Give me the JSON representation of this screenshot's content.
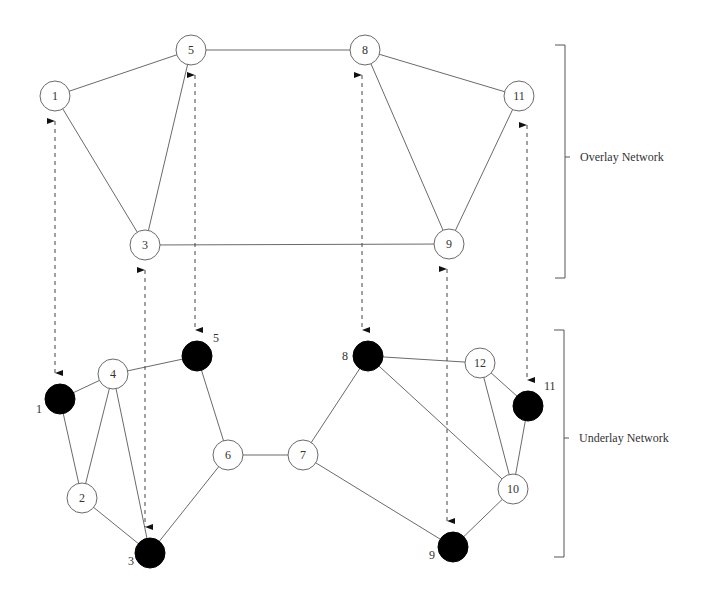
{
  "diagram": {
    "overlay": {
      "label": "Overlay Network",
      "bracket": {
        "x": 565,
        "y_top": 45,
        "y_bottom": 278,
        "tick_y": 157
      },
      "nodes": [
        {
          "id": "1",
          "label": "1",
          "x": 55,
          "y": 96
        },
        {
          "id": "5",
          "label": "5",
          "x": 191,
          "y": 50
        },
        {
          "id": "8",
          "label": "8",
          "x": 365,
          "y": 50
        },
        {
          "id": "11",
          "label": "11",
          "x": 519,
          "y": 96
        },
        {
          "id": "3",
          "label": "3",
          "x": 145,
          "y": 245
        },
        {
          "id": "9",
          "label": "9",
          "x": 449,
          "y": 244
        }
      ],
      "edges": [
        [
          "1",
          "5"
        ],
        [
          "1",
          "3"
        ],
        [
          "5",
          "3"
        ],
        [
          "5",
          "8"
        ],
        [
          "8",
          "11"
        ],
        [
          "8",
          "9"
        ],
        [
          "11",
          "9"
        ],
        [
          "3",
          "9"
        ]
      ]
    },
    "underlay": {
      "label": "Underlay Network",
      "bracket": {
        "x": 564,
        "y_top": 330,
        "y_bottom": 557,
        "tick_y": 438
      },
      "nodes": [
        {
          "id": "1",
          "label": "1",
          "x": 60,
          "y": 399,
          "filled": true
        },
        {
          "id": "2",
          "label": "2",
          "x": 82,
          "y": 498,
          "filled": false
        },
        {
          "id": "3",
          "label": "3",
          "x": 150,
          "y": 553,
          "filled": true
        },
        {
          "id": "4",
          "label": "4",
          "x": 113,
          "y": 374,
          "filled": false
        },
        {
          "id": "5",
          "label": "5",
          "x": 197,
          "y": 356,
          "filled": true
        },
        {
          "id": "6",
          "label": "6",
          "x": 228,
          "y": 455,
          "filled": false
        },
        {
          "id": "7",
          "label": "7",
          "x": 303,
          "y": 455,
          "filled": false
        },
        {
          "id": "8",
          "label": "8",
          "x": 368,
          "y": 356,
          "filled": true
        },
        {
          "id": "9",
          "label": "9",
          "x": 453,
          "y": 547,
          "filled": true
        },
        {
          "id": "10",
          "label": "10",
          "x": 513,
          "y": 489,
          "filled": false
        },
        {
          "id": "11",
          "label": "11",
          "x": 528,
          "y": 406,
          "filled": true
        },
        {
          "id": "12",
          "label": "12",
          "x": 480,
          "y": 363,
          "filled": false
        }
      ],
      "edges": [
        [
          "1",
          "4"
        ],
        [
          "1",
          "2"
        ],
        [
          "4",
          "2"
        ],
        [
          "4",
          "3"
        ],
        [
          "4",
          "5"
        ],
        [
          "2",
          "3"
        ],
        [
          "3",
          "6"
        ],
        [
          "5",
          "6"
        ],
        [
          "6",
          "7"
        ],
        [
          "7",
          "8"
        ],
        [
          "7",
          "9"
        ],
        [
          "8",
          "12"
        ],
        [
          "8",
          "10"
        ],
        [
          "12",
          "11"
        ],
        [
          "12",
          "10"
        ],
        [
          "11",
          "10"
        ],
        [
          "10",
          "9"
        ]
      ]
    },
    "mappings": [
      {
        "overlay": "1",
        "underlay": "1",
        "x": 55,
        "y_top": 113,
        "y_bottom": 381
      },
      {
        "overlay": "5",
        "underlay": "5",
        "x": 195,
        "y_top": 67,
        "y_bottom": 338
      },
      {
        "overlay": "3",
        "underlay": "3",
        "x": 145,
        "y_top": 262,
        "y_bottom": 535
      },
      {
        "overlay": "8",
        "underlay": "8",
        "x": 362,
        "y_top": 67,
        "y_bottom": 338
      },
      {
        "overlay": "9",
        "underlay": "9",
        "x": 447,
        "y_top": 261,
        "y_bottom": 529
      },
      {
        "overlay": "11",
        "underlay": "11",
        "x": 527,
        "y_top": 117,
        "y_bottom": 388
      }
    ],
    "node_radius": 15
  }
}
